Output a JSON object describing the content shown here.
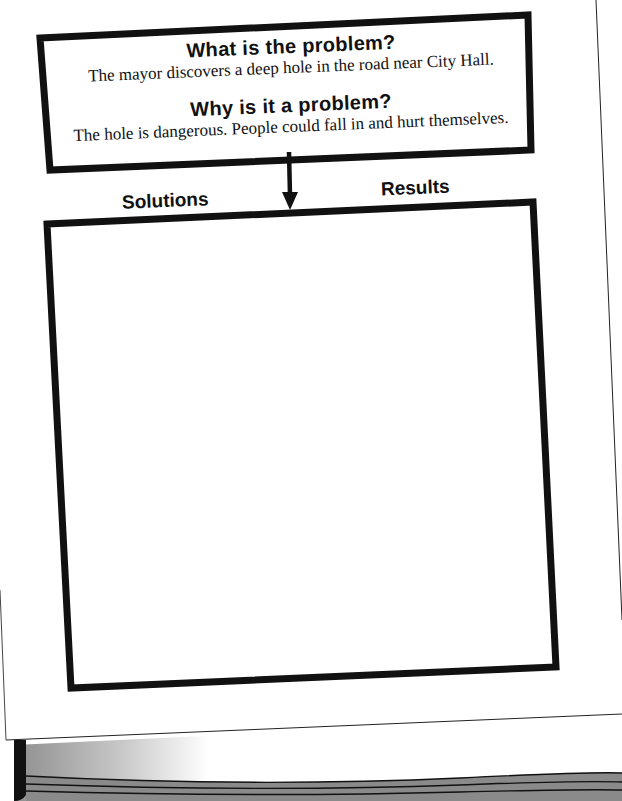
{
  "worksheet": {
    "problem_box": {
      "question_1": "What is the problem?",
      "answer_1": "The mayor discovers a deep hole in the road near City Hall.",
      "question_2": "Why is it a problem?",
      "answer_2": "The hole is dangerous. People could fall in and hurt themselves."
    },
    "columns": {
      "left_label": "Solutions",
      "right_label": "Results"
    },
    "response_box": {
      "content": ""
    }
  },
  "colors": {
    "ink": "#111111",
    "paper": "#ffffff",
    "book_page_gray": "#8a8a8a"
  }
}
